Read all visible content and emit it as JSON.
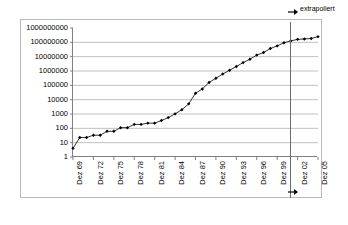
{
  "chart_data": {
    "type": "line",
    "title": "",
    "subtitle": "",
    "xlabel": "",
    "ylabel": "",
    "yscale": "log",
    "ylim": [
      1,
      1000000000
    ],
    "grid": true,
    "legend_position": "none",
    "ytick_labels": [
      "1000000000",
      "100000000",
      "10000000",
      "1000000",
      "100000",
      "10000",
      "1000",
      "100",
      "10",
      "1"
    ],
    "ytick_values": [
      1000000000,
      100000000,
      10000000,
      1000000,
      100000,
      10000,
      1000,
      100,
      10,
      1
    ],
    "xtick_labels": [
      "Dez 69",
      "Dez 72",
      "Dez 75",
      "Dez 78",
      "Dez 81",
      "Dez 84",
      "Dez 87",
      "Dez 90",
      "Dez 93",
      "Dez 96",
      "Dez 99",
      "Dez 02",
      "Dez 05"
    ],
    "x": [
      1969,
      1970,
      1971,
      1972,
      1973,
      1974,
      1975,
      1976,
      1977,
      1978,
      1979,
      1980,
      1981,
      1982,
      1983,
      1984,
      1985,
      1986,
      1987,
      1988,
      1989,
      1990,
      1991,
      1992,
      1993,
      1994,
      1995,
      1996,
      1997,
      1998,
      1999,
      2000,
      2001,
      2002,
      2003,
      2004,
      2005
    ],
    "series": [
      {
        "name": "Hosts",
        "values": [
          4,
          23,
          23,
          33,
          33,
          62,
          62,
          111,
          111,
          188,
          188,
          230,
          230,
          350,
          562,
          1024,
          2000,
          5089,
          28174,
          56000,
          159000,
          313000,
          617000,
          1136000,
          2056000,
          3864000,
          6642000,
          12881000,
          19540000,
          36739000,
          56218000,
          93047785,
          125888197,
          162128493,
          171638297,
          185000000,
          250000000
        ]
      }
    ],
    "annotations": [
      {
        "name": "extrapolation-divider",
        "label": "extrapoliert",
        "x_value": 2003.2,
        "type": "vline"
      }
    ],
    "marker": "diamond",
    "marker_color": "#000000",
    "line_color": "#000000",
    "grid_color": "#c0c0c0",
    "axis_color": "#808080",
    "frame_color": "#b9b9b9"
  }
}
